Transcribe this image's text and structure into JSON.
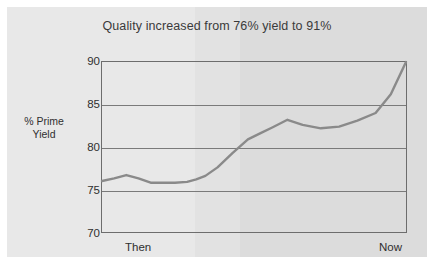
{
  "chart_data": {
    "type": "line",
    "title": "Quality increased from 76% yield to 91%",
    "xlabel": "",
    "ylabel": "% Prime Yield",
    "ylabel_line1": "% Prime",
    "ylabel_line2": "Yield",
    "ylim": [
      70,
      90
    ],
    "yticks": [
      90,
      85,
      80,
      75,
      70
    ],
    "ytick_labels": [
      "90",
      "85",
      "80",
      "75",
      "70"
    ],
    "gridlines": [
      85,
      80,
      75
    ],
    "grid": true,
    "legend": null,
    "xtick_labels": [
      "Then",
      "Now"
    ],
    "x": [
      0,
      4,
      8,
      12,
      16,
      20,
      24,
      28,
      31,
      34,
      38,
      43,
      48,
      52,
      56,
      61,
      66,
      72,
      78,
      84,
      90,
      95,
      100
    ],
    "values": [
      76.0,
      76.3,
      76.7,
      76.3,
      75.8,
      75.8,
      75.8,
      75.9,
      76.2,
      76.6,
      77.6,
      79.3,
      80.9,
      81.6,
      82.3,
      83.2,
      82.6,
      82.2,
      82.4,
      83.1,
      84.0,
      86.2,
      90.0
    ],
    "series": [
      {
        "name": "% Prime Yield",
        "color": "#8a8a8a",
        "values": [
          76.0,
          76.3,
          76.7,
          76.3,
          75.8,
          75.8,
          75.8,
          75.9,
          76.2,
          76.6,
          77.6,
          79.3,
          80.9,
          81.6,
          82.3,
          83.2,
          82.6,
          82.2,
          82.4,
          83.1,
          84.0,
          86.2,
          90.0
        ]
      }
    ],
    "annotations": {
      "start_value": "76%",
      "end_value": "91%"
    },
    "colors": {
      "line": "#8a8a8a",
      "axis": "#6d6d6d",
      "grid": "#7a7a7a",
      "background": "#e4e4e4",
      "text": "#2f2f2f"
    }
  },
  "axis": {
    "y_title_line1": "% Prime",
    "y_title_line2": "Yield",
    "y_tick_90": "90",
    "y_tick_85": "85",
    "y_tick_80": "80",
    "y_tick_75": "75",
    "y_tick_70": "70",
    "x_tick_left": "Then",
    "x_tick_right": "Now"
  },
  "header": {
    "title": "Quality increased from 76% yield to 91%"
  }
}
